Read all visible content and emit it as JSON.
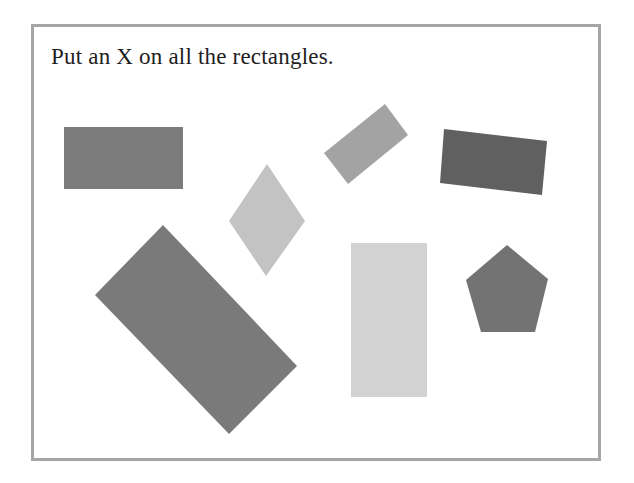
{
  "worksheet": {
    "instruction": "Put an X on all the rectangles.",
    "border_color": "#a6a6a6"
  },
  "shapes": [
    {
      "id": "rect-top-left",
      "kind": "rectangle",
      "color": "#7b7b7b",
      "points": "64,127 183,127 183,189 64,189"
    },
    {
      "id": "rect-small-tilted",
      "kind": "rectangle",
      "color": "#a3a3a3",
      "points": "324,153 385,104 408,135 348,184"
    },
    {
      "id": "rect-dark-tilted",
      "kind": "rectangle",
      "color": "#606060",
      "points": "444,129 547,141 542,195 440,183"
    },
    {
      "id": "rhombus",
      "kind": "rhombus",
      "color": "#c3c3c3",
      "points": "267,164 305,221 266,276 229,221"
    },
    {
      "id": "rect-large-tilted",
      "kind": "rectangle",
      "color": "#7a7a7a",
      "points": "163,225 297,366 229,434 95,295"
    },
    {
      "id": "rect-tall",
      "kind": "rectangle",
      "color": "#d2d2d2",
      "points": "351,243 427,243 427,397 351,397"
    },
    {
      "id": "pentagon",
      "kind": "pentagon",
      "color": "#737373",
      "points": "507,245 548,279 535,332 481,332 466,280"
    }
  ]
}
